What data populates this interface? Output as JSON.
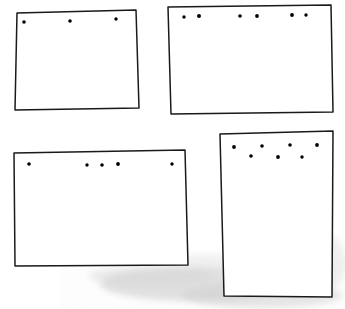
{
  "figure": {
    "background_color": "#ffffff",
    "ink_color": "#1a1a1a",
    "dot_color": "#000000",
    "canvas": {
      "width": 345,
      "height": 309
    },
    "style": "hand-drawn ink sketch, scanned",
    "panel_count": 4,
    "total_dot_count": 21
  },
  "panels": [
    {
      "id": "panel-top-left",
      "label": "top-left panel",
      "orientation": "landscape",
      "dot_count": 3,
      "dot_arrangement": "single row, evenly spaced",
      "outline_points": "17,13 136,10 139,108 15,110",
      "dots": [
        {
          "x": 24,
          "y": 22,
          "r": 1.8
        },
        {
          "x": 70,
          "y": 21,
          "r": 1.8
        },
        {
          "x": 116,
          "y": 19,
          "r": 1.7
        }
      ]
    },
    {
      "id": "panel-top-right",
      "label": "top-right panel",
      "orientation": "landscape",
      "dot_count": 6,
      "dot_arrangement": "single row, three pairs",
      "outline_points": "168,7 331,5 333,112 171,114",
      "dots": [
        {
          "x": 184,
          "y": 17,
          "r": 1.7
        },
        {
          "x": 199,
          "y": 16,
          "r": 2.0
        },
        {
          "x": 240,
          "y": 16,
          "r": 1.8
        },
        {
          "x": 257,
          "y": 16,
          "r": 1.9
        },
        {
          "x": 292,
          "y": 15,
          "r": 1.9
        },
        {
          "x": 306,
          "y": 15,
          "r": 1.7
        }
      ]
    },
    {
      "id": "panel-bottom-left",
      "label": "bottom-left panel",
      "orientation": "landscape",
      "dot_count": 5,
      "dot_arrangement": "single row, one left, three clustered center, one right",
      "outline_points": "14,153 185,150 188,265 15,266",
      "dots": [
        {
          "x": 29,
          "y": 164,
          "r": 1.8
        },
        {
          "x": 87,
          "y": 165,
          "r": 1.7
        },
        {
          "x": 102,
          "y": 165,
          "r": 1.8
        },
        {
          "x": 118,
          "y": 164,
          "r": 1.9
        },
        {
          "x": 172,
          "y": 164,
          "r": 1.7
        }
      ]
    },
    {
      "id": "panel-bottom-right",
      "label": "bottom-right panel",
      "orientation": "portrait",
      "dot_count": 7,
      "dot_arrangement": "staggered zigzag, two rows",
      "outline_points": "220,134 333,131 332,297 224,296",
      "dots": [
        {
          "x": 234,
          "y": 147,
          "r": 1.9
        },
        {
          "x": 251,
          "y": 156,
          "r": 1.8
        },
        {
          "x": 262,
          "y": 146,
          "r": 1.8
        },
        {
          "x": 278,
          "y": 157,
          "r": 1.9
        },
        {
          "x": 290,
          "y": 145,
          "r": 1.8
        },
        {
          "x": 302,
          "y": 157,
          "r": 1.7
        },
        {
          "x": 317,
          "y": 145,
          "r": 1.9
        }
      ]
    }
  ],
  "artifacts": {
    "label": "scan shadow smudge",
    "description": "faint mottled gray band across lower center-right of the scan",
    "color": "#c9c9c9"
  }
}
